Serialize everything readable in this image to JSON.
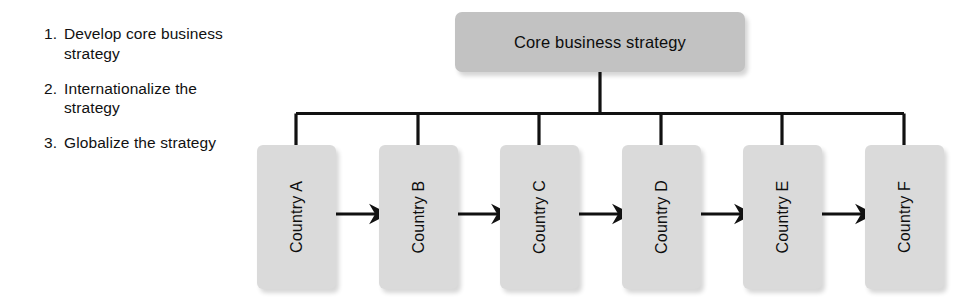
{
  "diagram": {
    "title_box": {
      "label": "Core business strategy",
      "fill_color": "#c2c2c2"
    },
    "steps": [
      {
        "number": "1.",
        "text": "Develop core business strategy"
      },
      {
        "number": "2.",
        "text": "Internationalize the strategy"
      },
      {
        "number": "3.",
        "text": "Globalize the strategy"
      }
    ],
    "nodes": [
      {
        "label": "Country A"
      },
      {
        "label": "Country B"
      },
      {
        "label": "Country C"
      },
      {
        "label": "Country D"
      },
      {
        "label": "Country E"
      },
      {
        "label": "Country F"
      }
    ],
    "node_fill_color": "#dadada",
    "line_color": "#111111",
    "connector_type": "tree-bus",
    "peer_links": [
      {
        "from": "Country A",
        "to": "Country B",
        "style": "double-arrow"
      },
      {
        "from": "Country B",
        "to": "Country C",
        "style": "double-arrow"
      },
      {
        "from": "Country C",
        "to": "Country D",
        "style": "double-arrow"
      },
      {
        "from": "Country D",
        "to": "Country E",
        "style": "double-arrow"
      },
      {
        "from": "Country E",
        "to": "Country F",
        "style": "double-arrow"
      }
    ]
  }
}
